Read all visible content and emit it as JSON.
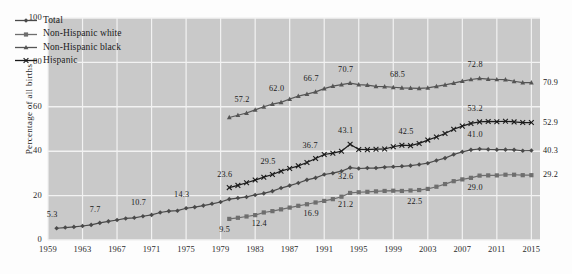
{
  "chart_data": {
    "type": "line",
    "title": "",
    "xlabel": "",
    "ylabel": "Percentage of all births",
    "xlim": [
      1959,
      2016
    ],
    "ylim": [
      0,
      100
    ],
    "grid": true,
    "legend_position": "upper-left",
    "y_ticks": [
      "0",
      "20",
      "40",
      "60",
      "80",
      "100"
    ],
    "y_tick_values": [
      0,
      20,
      40,
      60,
      80,
      100
    ],
    "x_ticks": [
      "1959",
      "1963",
      "1967",
      "1971",
      "1975",
      "1979",
      "1983",
      "1987",
      "1991",
      "1995",
      "1999",
      "2003",
      "2007",
      "2011",
      "2015"
    ],
    "x_tick_values": [
      1959,
      1963,
      1967,
      1971,
      1975,
      1979,
      1983,
      1987,
      1991,
      1995,
      1999,
      2003,
      2007,
      2011,
      2015
    ],
    "series": [
      {
        "name": "Total",
        "marker": "diamond",
        "color": "#4a4a4a",
        "x": [
          1960,
          1961,
          1962,
          1963,
          1964,
          1965,
          1966,
          1967,
          1968,
          1969,
          1970,
          1971,
          1972,
          1973,
          1974,
          1975,
          1976,
          1977,
          1978,
          1979,
          1980,
          1981,
          1982,
          1983,
          1984,
          1985,
          1986,
          1987,
          1988,
          1989,
          1990,
          1991,
          1992,
          1993,
          1994,
          1995,
          1996,
          1997,
          1998,
          1999,
          2000,
          2001,
          2002,
          2003,
          2004,
          2005,
          2006,
          2007,
          2008,
          2009,
          2010,
          2011,
          2012,
          2013,
          2014,
          2015
        ],
        "values": [
          5.3,
          5.6,
          5.9,
          6.3,
          6.8,
          7.7,
          8.4,
          9.0,
          9.7,
          10.0,
          10.7,
          11.3,
          12.4,
          13.0,
          13.2,
          14.3,
          14.8,
          15.5,
          16.3,
          17.1,
          18.4,
          18.9,
          19.4,
          20.3,
          21.0,
          22.0,
          23.4,
          24.5,
          25.7,
          27.1,
          28.0,
          29.5,
          30.1,
          31.0,
          32.6,
          32.2,
          32.4,
          32.4,
          32.8,
          33.0,
          33.2,
          33.5,
          34.0,
          34.6,
          35.8,
          36.9,
          38.5,
          39.7,
          40.6,
          41.0,
          40.8,
          40.7,
          40.7,
          40.6,
          40.2,
          40.3
        ],
        "labeled_points": [
          {
            "x": 1960,
            "value": 5.3
          },
          {
            "x": 1965,
            "value": 7.7
          },
          {
            "x": 1970,
            "value": 10.7
          },
          {
            "x": 1975,
            "value": 14.3
          },
          {
            "x": 1994,
            "value": 32.6
          },
          {
            "x": 2009,
            "value": 41.0
          },
          {
            "x": 2015,
            "value": 40.3
          }
        ]
      },
      {
        "name": "Non-Hispanic white",
        "marker": "square",
        "color": "#6e6e6e",
        "x": [
          1980,
          1981,
          1982,
          1983,
          1984,
          1985,
          1986,
          1987,
          1988,
          1989,
          1990,
          1991,
          1992,
          1993,
          1994,
          1995,
          1996,
          1997,
          1998,
          1999,
          2000,
          2001,
          2002,
          2003,
          2004,
          2005,
          2006,
          2007,
          2008,
          2009,
          2010,
          2011,
          2012,
          2013,
          2014,
          2015
        ],
        "values": [
          9.5,
          10.0,
          10.6,
          11.2,
          12.4,
          13.0,
          13.8,
          14.6,
          15.4,
          16.1,
          16.9,
          17.6,
          18.4,
          19.5,
          21.2,
          21.5,
          21.7,
          21.9,
          22.1,
          22.2,
          22.1,
          22.3,
          22.5,
          23.0,
          24.0,
          25.2,
          26.5,
          27.3,
          28.0,
          29.0,
          29.1,
          29.1,
          29.4,
          29.4,
          29.2,
          29.2
        ],
        "labeled_points": [
          {
            "x": 1980,
            "value": 9.5
          },
          {
            "x": 1984,
            "value": 12.4
          },
          {
            "x": 1990,
            "value": 16.9
          },
          {
            "x": 1994,
            "value": 21.2
          },
          {
            "x": 2002,
            "value": 22.5
          },
          {
            "x": 2009,
            "value": 29.0
          },
          {
            "x": 2015,
            "value": 29.2
          }
        ]
      },
      {
        "name": "Non-Hispanic black",
        "marker": "triangle",
        "color": "#555555",
        "x": [
          1980,
          1981,
          1982,
          1983,
          1984,
          1985,
          1986,
          1987,
          1988,
          1989,
          1990,
          1991,
          1992,
          1993,
          1994,
          1995,
          1996,
          1997,
          1998,
          1999,
          2000,
          2001,
          2002,
          2003,
          2004,
          2005,
          2006,
          2007,
          2008,
          2009,
          2010,
          2011,
          2012,
          2013,
          2014,
          2015
        ],
        "values": [
          55.2,
          56.2,
          57.2,
          58.6,
          60.0,
          61.2,
          62.0,
          63.5,
          64.8,
          65.7,
          66.7,
          68.2,
          69.3,
          70.0,
          70.7,
          70.0,
          69.8,
          69.2,
          69.1,
          68.8,
          68.5,
          68.4,
          68.3,
          68.5,
          69.2,
          69.9,
          70.7,
          71.6,
          72.3,
          72.8,
          72.5,
          72.3,
          72.2,
          71.5,
          70.9,
          70.9
        ],
        "labeled_points": [
          {
            "x": 1982,
            "value": 57.2
          },
          {
            "x": 1986,
            "value": 62.0
          },
          {
            "x": 1990,
            "value": 66.7
          },
          {
            "x": 1994,
            "value": 70.7
          },
          {
            "x": 2000,
            "value": 68.5
          },
          {
            "x": 2009,
            "value": 72.8
          },
          {
            "x": 2015,
            "value": 70.9
          }
        ]
      },
      {
        "name": "Hispanic",
        "marker": "cross",
        "color": "#1a1a1a",
        "x": [
          1980,
          1981,
          1982,
          1983,
          1984,
          1985,
          1986,
          1987,
          1988,
          1989,
          1990,
          1991,
          1992,
          1993,
          1994,
          1995,
          1996,
          1997,
          1998,
          1999,
          2000,
          2001,
          2002,
          2003,
          2004,
          2005,
          2006,
          2007,
          2008,
          2009,
          2010,
          2011,
          2012,
          2013,
          2014,
          2015
        ],
        "values": [
          23.6,
          24.6,
          25.8,
          27.0,
          28.3,
          29.5,
          31.0,
          32.2,
          33.4,
          34.9,
          36.7,
          38.5,
          39.1,
          40.0,
          43.1,
          40.8,
          40.7,
          40.9,
          41.0,
          42.0,
          42.7,
          42.5,
          43.5,
          45.0,
          46.4,
          48.0,
          49.9,
          51.3,
          52.5,
          53.2,
          53.4,
          53.3,
          53.5,
          53.2,
          52.9,
          52.9
        ],
        "labeled_points": [
          {
            "x": 1980,
            "value": 23.6
          },
          {
            "x": 1985,
            "value": 29.5
          },
          {
            "x": 1990,
            "value": 36.7
          },
          {
            "x": 1994,
            "value": 43.1
          },
          {
            "x": 2001,
            "value": 42.5
          },
          {
            "x": 2009,
            "value": 53.2
          },
          {
            "x": 2015,
            "value": 52.9
          }
        ]
      }
    ],
    "annotations": [
      {
        "text": "5.3",
        "series": "Total",
        "x": 1960,
        "dx": -4,
        "dy": -14
      },
      {
        "text": "7.7",
        "series": "Total",
        "x": 1965,
        "dx": -4,
        "dy": -14
      },
      {
        "text": "10.7",
        "series": "Total",
        "x": 1970,
        "dx": -6,
        "dy": -14
      },
      {
        "text": "14.3",
        "series": "Total",
        "x": 1975,
        "dx": -6,
        "dy": -14
      },
      {
        "text": "32.6",
        "series": "Total",
        "x": 1994,
        "dx": -6,
        "dy": 8
      },
      {
        "text": "41.0",
        "series": "Total",
        "x": 2009,
        "dx": -6,
        "dy": -15
      },
      {
        "text": "9.5",
        "series": "Non-Hispanic white",
        "x": 1980,
        "dx": -4,
        "dy": 10
      },
      {
        "text": "12.4",
        "series": "Non-Hispanic white",
        "x": 1984,
        "dx": -6,
        "dy": 11
      },
      {
        "text": "16.9",
        "series": "Non-Hispanic white",
        "x": 1990,
        "dx": -6,
        "dy": 11
      },
      {
        "text": "21.2",
        "series": "Non-Hispanic white",
        "x": 1994,
        "dx": -6,
        "dy": 11
      },
      {
        "text": "22.5",
        "series": "Non-Hispanic white",
        "x": 2002,
        "dx": -6,
        "dy": 11
      },
      {
        "text": "29.0",
        "series": "Non-Hispanic white",
        "x": 2009,
        "dx": -6,
        "dy": 11
      },
      {
        "text": "57.2",
        "series": "Non-Hispanic black",
        "x": 1982,
        "dx": -6,
        "dy": -14
      },
      {
        "text": "62.0",
        "series": "Non-Hispanic black",
        "x": 1986,
        "dx": -6,
        "dy": -14
      },
      {
        "text": "66.7",
        "series": "Non-Hispanic black",
        "x": 1990,
        "dx": -6,
        "dy": -14
      },
      {
        "text": "70.7",
        "series": "Non-Hispanic black",
        "x": 1994,
        "dx": -6,
        "dy": -14
      },
      {
        "text": "68.5",
        "series": "Non-Hispanic black",
        "x": 2000,
        "dx": -6,
        "dy": -14
      },
      {
        "text": "72.8",
        "series": "Non-Hispanic black",
        "x": 2009,
        "dx": -6,
        "dy": -14
      },
      {
        "text": "23.6",
        "series": "Hispanic",
        "x": 1980,
        "dx": -6,
        "dy": -14
      },
      {
        "text": "29.5",
        "series": "Hispanic",
        "x": 1985,
        "dx": -6,
        "dy": -14
      },
      {
        "text": "36.7",
        "series": "Hispanic",
        "x": 1990,
        "dx": -7,
        "dy": -14
      },
      {
        "text": "43.1",
        "series": "Hispanic",
        "x": 1994,
        "dx": -6,
        "dy": -14
      },
      {
        "text": "42.5",
        "series": "Hispanic",
        "x": 2001,
        "dx": -6,
        "dy": -15
      },
      {
        "text": "53.2",
        "series": "Hispanic",
        "x": 2009,
        "dx": -6,
        "dy": -14
      }
    ],
    "end_labels": [
      {
        "text": "70.9",
        "series": "Non-Hispanic black",
        "value": 70.9
      },
      {
        "text": "52.9",
        "series": "Hispanic",
        "value": 52.9
      },
      {
        "text": "40.3",
        "series": "Total",
        "value": 40.3
      },
      {
        "text": "29.2",
        "series": "Non-Hispanic white",
        "value": 29.2
      }
    ],
    "style": {
      "plot_background": "#c9c9c9",
      "grid_color": "#f2f2f2",
      "figure_background": "#fdfdfd",
      "text_color": "#1a1a1a"
    }
  },
  "legend": {
    "items": [
      {
        "label": "Total",
        "marker": "diamond"
      },
      {
        "label": "Non-Hispanic white",
        "marker": "square"
      },
      {
        "label": "Non-Hispanic black",
        "marker": "triangle"
      },
      {
        "label": "Hispanic",
        "marker": "cross"
      }
    ]
  }
}
